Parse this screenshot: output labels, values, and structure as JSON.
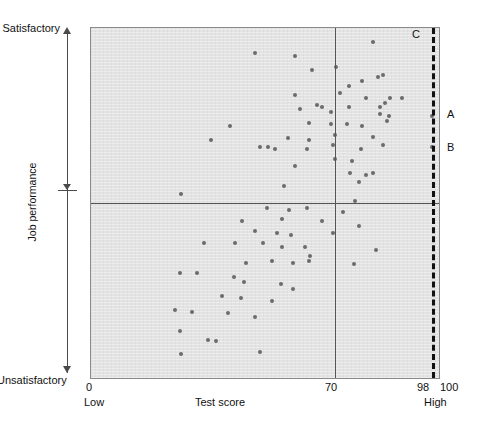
{
  "chart_data": {
    "type": "scatter",
    "title": "",
    "xlabel": "Test score",
    "ylabel": "Job performance",
    "xlim": [
      0,
      100
    ],
    "ylim": [
      0,
      100
    ],
    "grid": false,
    "legend": "none",
    "x_axis": {
      "label": "Test score",
      "ticks": [
        {
          "value": 0,
          "text": "0"
        },
        {
          "value": 70,
          "text": "70"
        },
        {
          "value": 98,
          "text": "98"
        },
        {
          "value": 100,
          "text": "100"
        }
      ],
      "end_labels": {
        "low": "Low",
        "high": "High"
      }
    },
    "y_axis": {
      "label": "Job performance",
      "top_label": "Satisfactory",
      "bottom_label": "Unsatisfactory",
      "midpoint_marked": true
    },
    "reference_lines": [
      {
        "name": "test-cutoff-70",
        "orientation": "vertical",
        "value": 70,
        "style": "solid"
      },
      {
        "name": "performance-midline",
        "orientation": "horizontal",
        "value": 50,
        "style": "solid"
      },
      {
        "name": "test-cutoff-98",
        "orientation": "vertical",
        "value": 98,
        "style": "dashed"
      }
    ],
    "annotations": [
      {
        "label": "C",
        "x": 96.5,
        "y": 99,
        "describes": "upper cut score marker"
      },
      {
        "label": "A",
        "x": 98,
        "y": 75,
        "describes": "applicant A above midline"
      },
      {
        "label": "B",
        "x": 98,
        "y": 66,
        "describes": "applicant B above midline"
      }
    ],
    "points": [
      [
        47.0,
        93.0
      ],
      [
        58.5,
        92.0
      ],
      [
        70.5,
        89.0
      ],
      [
        81.0,
        96.0
      ],
      [
        78.0,
        85.0
      ],
      [
        82.5,
        86.0
      ],
      [
        84.0,
        86.5
      ],
      [
        74.0,
        83.5
      ],
      [
        63.5,
        88.0
      ],
      [
        58.5,
        81.0
      ],
      [
        71.5,
        81.5
      ],
      [
        79.0,
        80.0
      ],
      [
        86.0,
        80.0
      ],
      [
        89.5,
        80.0
      ],
      [
        60.0,
        77.0
      ],
      [
        65.0,
        78.0
      ],
      [
        66.5,
        77.5
      ],
      [
        69.0,
        76.0
      ],
      [
        74.0,
        77.5
      ],
      [
        83.0,
        77.5
      ],
      [
        84.5,
        78.5
      ],
      [
        83.0,
        75.5
      ],
      [
        85.5,
        75.0
      ],
      [
        40.0,
        72.0
      ],
      [
        62.5,
        73.0
      ],
      [
        69.0,
        72.5
      ],
      [
        73.5,
        72.5
      ],
      [
        78.0,
        72.0
      ],
      [
        85.0,
        73.5
      ],
      [
        34.5,
        68.0
      ],
      [
        56.5,
        68.5
      ],
      [
        62.5,
        68.0
      ],
      [
        70.0,
        69.5
      ],
      [
        81.0,
        69.0
      ],
      [
        48.5,
        66.0
      ],
      [
        51.0,
        66.0
      ],
      [
        53.0,
        65.5
      ],
      [
        62.0,
        65.5
      ],
      [
        69.5,
        66.5
      ],
      [
        77.5,
        65.5
      ],
      [
        84.0,
        66.5
      ],
      [
        70.0,
        62.5
      ],
      [
        75.0,
        62.0
      ],
      [
        58.5,
        60.5
      ],
      [
        74.5,
        58.5
      ],
      [
        79.0,
        58.0
      ],
      [
        81.0,
        58.5
      ],
      [
        77.0,
        56.0
      ],
      [
        55.5,
        55.0
      ],
      [
        26.0,
        52.5
      ],
      [
        76.0,
        50.5
      ],
      [
        50.5,
        48.5
      ],
      [
        57.0,
        48.0
      ],
      [
        62.0,
        48.5
      ],
      [
        72.5,
        47.5
      ],
      [
        43.5,
        45.0
      ],
      [
        55.0,
        45.5
      ],
      [
        66.5,
        45.0
      ],
      [
        77.0,
        43.5
      ],
      [
        47.0,
        42.0
      ],
      [
        53.5,
        41.5
      ],
      [
        57.5,
        41.0
      ],
      [
        69.5,
        41.5
      ],
      [
        32.5,
        38.5
      ],
      [
        41.5,
        38.5
      ],
      [
        49.5,
        38.5
      ],
      [
        55.0,
        37.5
      ],
      [
        61.5,
        37.5
      ],
      [
        63.0,
        35.0
      ],
      [
        82.0,
        36.5
      ],
      [
        44.5,
        33.0
      ],
      [
        52.0,
        33.5
      ],
      [
        58.0,
        33.0
      ],
      [
        62.5,
        33.5
      ],
      [
        75.5,
        32.5
      ],
      [
        25.5,
        30.0
      ],
      [
        30.5,
        30.0
      ],
      [
        41.0,
        29.0
      ],
      [
        44.0,
        27.5
      ],
      [
        54.5,
        27.0
      ],
      [
        58.0,
        25.5
      ],
      [
        37.5,
        23.5
      ],
      [
        43.0,
        23.0
      ],
      [
        52.0,
        22.0
      ],
      [
        24.0,
        19.5
      ],
      [
        29.0,
        19.0
      ],
      [
        39.5,
        18.5
      ],
      [
        47.0,
        17.5
      ],
      [
        25.5,
        13.5
      ],
      [
        33.5,
        11.0
      ],
      [
        36.0,
        10.5
      ],
      [
        26.0,
        7.0
      ],
      [
        48.5,
        7.5
      ],
      [
        98.0,
        75.0
      ],
      [
        98.0,
        66.0
      ]
    ],
    "point_count": 95,
    "marker": {
      "shape": "circle",
      "color": "#6b6b6b",
      "size_px": 4
    }
  },
  "labels": {
    "satisfactory": "Satisfactory",
    "unsatisfactory": "Unsatisfactory",
    "job_performance": "Job performance",
    "test_score": "Test score",
    "zero": "0",
    "low": "Low",
    "seventy": "70",
    "ninety_eight": "98",
    "hundred": "100",
    "high": "High",
    "point_a": "A",
    "point_b": "B",
    "marker_c": "C"
  },
  "colors": {
    "panel_background": "#e3e3e3",
    "panel_border": "#8a8a8a",
    "marker": "#6b6b6b",
    "reference_line": "#555555",
    "dashed_line": "#111111",
    "text": "#111111"
  }
}
